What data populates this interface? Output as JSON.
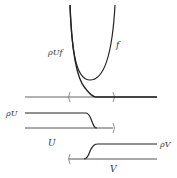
{
  "diagram": {
    "labels": {
      "rho_u_f": "ρUf",
      "f": "f",
      "rho_u": "ρU",
      "u": "U",
      "rho_v": "ρV",
      "v": "V"
    },
    "colors": {
      "curve": "#222222",
      "axis": "#555555",
      "text": "#333333"
    }
  }
}
